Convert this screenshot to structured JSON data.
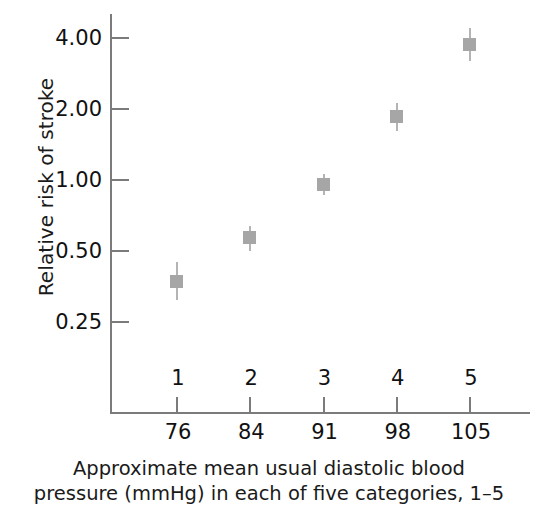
{
  "chart_data": {
    "type": "scatter",
    "title": "",
    "subtitle": "",
    "xlabel": "Approximate mean usual diastolic blood pressure (mmHg) in each of five categories, 1–5",
    "ylabel": "Relative risk of stroke",
    "yscale": "log",
    "ylim": [
      0.19,
      5.0
    ],
    "grid": false,
    "legend": null,
    "y_ticks": [
      {
        "label": "4.00",
        "value": 4.0
      },
      {
        "label": "2.00",
        "value": 2.0
      },
      {
        "label": "1.00",
        "value": 1.0
      },
      {
        "label": "0.50",
        "value": 0.5
      },
      {
        "label": "0.25",
        "value": 0.25
      }
    ],
    "x_categories": [
      "1",
      "2",
      "3",
      "4",
      "5"
    ],
    "x_values": [
      "76",
      "84",
      "91",
      "98",
      "105"
    ],
    "points": [
      {
        "category": "1",
        "x": 76,
        "y": 0.37,
        "y_low": 0.31,
        "y_high": 0.45
      },
      {
        "category": "2",
        "x": 84,
        "y": 0.57,
        "y_low": 0.5,
        "y_high": 0.64
      },
      {
        "category": "3",
        "x": 91,
        "y": 0.95,
        "y_low": 0.86,
        "y_high": 1.06
      },
      {
        "category": "4",
        "x": 98,
        "y": 1.85,
        "y_low": 1.62,
        "y_high": 2.12
      },
      {
        "category": "5",
        "x": 105,
        "y": 3.75,
        "y_low": 3.2,
        "y_high": 4.4
      }
    ],
    "marker_color": "#a6a6a6",
    "errorbar_color": "#b4b4b4",
    "axis_color": "#7b7b7b"
  },
  "caption": {
    "line1": "Approximate mean usual diastolic blood",
    "line2": "pressure (mmHg) in each of five categories, 1–5"
  },
  "axes": {
    "y_title": "Relative risk of stroke"
  }
}
